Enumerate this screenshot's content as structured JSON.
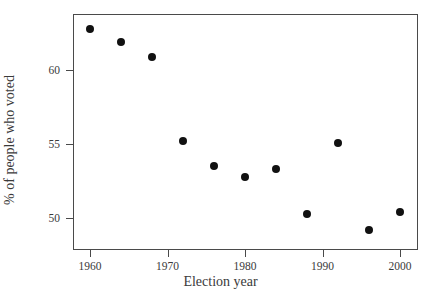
{
  "chart_data": {
    "type": "scatter",
    "title": "",
    "xlabel": "Election year",
    "ylabel": "% of people who voted",
    "x": [
      1960,
      1964,
      1968,
      1972,
      1976,
      1980,
      1984,
      1988,
      1992,
      1996,
      2000
    ],
    "values": [
      62.8,
      61.9,
      60.9,
      55.2,
      53.5,
      52.8,
      53.3,
      50.3,
      55.1,
      49.2,
      50.4
    ],
    "series": [
      {
        "name": "% of people who voted",
        "points": [
          {
            "x": 1960,
            "y": 62.8
          },
          {
            "x": 1964,
            "y": 61.9
          },
          {
            "x": 1968,
            "y": 60.9
          },
          {
            "x": 1972,
            "y": 55.2
          },
          {
            "x": 1976,
            "y": 53.5
          },
          {
            "x": 1980,
            "y": 52.8
          },
          {
            "x": 1984,
            "y": 53.3
          },
          {
            "x": 1988,
            "y": 50.3
          },
          {
            "x": 1992,
            "y": 55.1
          },
          {
            "x": 1996,
            "y": 49.2
          },
          {
            "x": 2000,
            "y": 50.4
          }
        ]
      }
    ],
    "xlim": [
      1957.8,
      1802.0
    ],
    "ylim": [
      48.4,
      63.9
    ],
    "xticks": [
      1960,
      1970,
      1980,
      1990,
      2000
    ],
    "xtick_labels": [
      "1960",
      "1970",
      "1980",
      "1990",
      "2000"
    ],
    "yticks": [
      50,
      55,
      60
    ],
    "ytick_labels": [
      "50",
      "55",
      "60"
    ],
    "grid": false,
    "legend": null,
    "marker_color": "#111111",
    "frame_color": "#4a4a4a",
    "background_color": "#ffffff"
  },
  "axes": {
    "x_title": "Election year",
    "y_title": "% of people who voted"
  }
}
